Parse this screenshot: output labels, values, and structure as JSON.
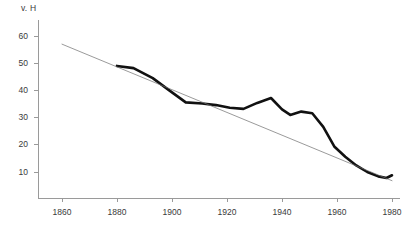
{
  "chart_data": {
    "type": "line",
    "title": "",
    "subtitle": "",
    "xlabel": "",
    "ylabel": "v. H",
    "unit_label": "v. H",
    "xlim": [
      1855,
      1982
    ],
    "ylim": [
      0,
      64
    ],
    "xticks": [
      1860,
      1880,
      1900,
      1920,
      1940,
      1960,
      1980
    ],
    "xtick_labels": [
      "1860",
      "1880",
      "1900",
      "1920",
      "1940",
      "1960",
      "1980"
    ],
    "yticks": [
      10,
      20,
      30,
      40,
      50,
      60
    ],
    "ytick_labels": [
      "10",
      "20",
      "30",
      "40",
      "50",
      "60"
    ],
    "grid": false,
    "legend": "none",
    "axis_color": "#9a9a9a",
    "series": [
      {
        "name": "observed",
        "style": "thick-line",
        "color": "#111111",
        "width": 2.6,
        "x": [
          1880,
          1886,
          1893,
          1899,
          1905,
          1911,
          1916,
          1921,
          1926,
          1931,
          1936,
          1940,
          1943,
          1947,
          1951,
          1955,
          1959,
          1963,
          1967,
          1971,
          1975,
          1978,
          1980
        ],
        "values": [
          49.0,
          48.2,
          44.5,
          40.0,
          35.6,
          35.2,
          34.6,
          33.6,
          33.2,
          35.4,
          37.2,
          33.0,
          31.0,
          32.2,
          31.6,
          26.6,
          19.4,
          15.6,
          12.4,
          10.0,
          8.4,
          7.8,
          8.8
        ]
      },
      {
        "name": "trend",
        "style": "thin-line",
        "color": "#6f6f6f",
        "width": 0.7,
        "x": [
          1860,
          1980
        ],
        "values": [
          57.0,
          6.8
        ]
      }
    ]
  }
}
